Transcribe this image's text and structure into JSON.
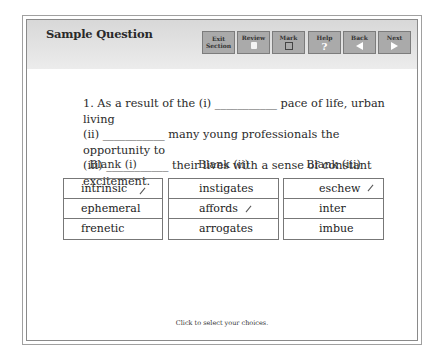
{
  "header": {
    "title": "Sample Question",
    "buttons": [
      {
        "id": "exit",
        "label_line1": "Exit",
        "label_line2": "Section",
        "icon": ""
      },
      {
        "id": "review",
        "label_line1": "Review",
        "icon": "review-page-icon"
      },
      {
        "id": "mark",
        "label_line1": "Mark",
        "icon": "checkbox-icon"
      },
      {
        "id": "help",
        "label_line1": "Help",
        "icon": "question-mark-icon",
        "glyph": "?"
      },
      {
        "id": "back",
        "label_line1": "Back",
        "icon": "left-arrow-icon"
      },
      {
        "id": "next",
        "label_line1": "Next",
        "icon": "right-arrow-icon"
      }
    ]
  },
  "question": {
    "line1": "1. As a result of the (i) ___________ pace of life, urban living",
    "line2": "(ii) ___________ many young professionals the opportunity to",
    "line3": "(iii) ___________ their lives with a sense of constant excitement."
  },
  "blanks": [
    {
      "label": "Blank (i)",
      "choices": [
        "intrinsic",
        "ephemeral",
        "frenetic"
      ],
      "marked_index": 0
    },
    {
      "label": "Blank (ii)",
      "choices": [
        "instigates",
        "affords",
        "arrogates"
      ],
      "marked_index": 1
    },
    {
      "label": "Blank (iii)",
      "choices": [
        "eschew",
        "inter",
        "imbue"
      ],
      "marked_index": 0
    }
  ],
  "footer": {
    "instruction": "Click to select your choices."
  },
  "colors": {
    "header_bg": "#e0e0e0",
    "button_bg": "#aaaaaa",
    "border": "#777777"
  }
}
